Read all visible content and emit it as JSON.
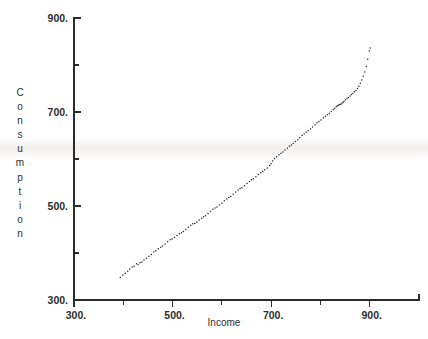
{
  "chart_data": {
    "type": "scatter",
    "title": "",
    "xlabel": "Income",
    "ylabel": "Consumption",
    "xlim": [
      300,
      1000
    ],
    "ylim": [
      300,
      900
    ],
    "grid": false,
    "legend": null,
    "x_ticks": [
      300,
      400,
      500,
      600,
      700,
      800,
      900,
      1000
    ],
    "x_tick_labels": [
      "300.",
      "",
      "500.",
      "",
      "700.",
      "",
      "900.",
      ""
    ],
    "y_ticks": [
      300,
      400,
      500,
      600,
      700,
      800,
      900
    ],
    "y_tick_labels": [
      "300.",
      "",
      "500.",
      "",
      "700.",
      "",
      "900."
    ],
    "marker": "dot",
    "marker_size": 1.5,
    "marker_color": "#23262b",
    "points": [
      [
        394,
        348
      ],
      [
        399,
        353
      ],
      [
        404,
        357
      ],
      [
        409,
        361
      ],
      [
        413,
        366
      ],
      [
        418,
        370
      ],
      [
        422,
        372
      ],
      [
        427,
        377
      ],
      [
        430,
        375
      ],
      [
        434,
        379
      ],
      [
        438,
        381
      ],
      [
        442,
        385
      ],
      [
        447,
        389
      ],
      [
        452,
        393
      ],
      [
        457,
        397
      ],
      [
        462,
        402
      ],
      [
        466,
        405
      ],
      [
        471,
        409
      ],
      [
        476,
        412
      ],
      [
        480,
        415
      ],
      [
        485,
        419
      ],
      [
        490,
        424
      ],
      [
        495,
        428
      ],
      [
        499,
        430
      ],
      [
        504,
        433
      ],
      [
        509,
        437
      ],
      [
        514,
        441
      ],
      [
        518,
        443
      ],
      [
        522,
        446
      ],
      [
        527,
        450
      ],
      [
        532,
        455
      ],
      [
        537,
        459
      ],
      [
        541,
        462
      ],
      [
        545,
        463
      ],
      [
        549,
        466
      ],
      [
        554,
        470
      ],
      [
        559,
        474
      ],
      [
        563,
        477
      ],
      [
        567,
        479
      ],
      [
        572,
        484
      ],
      [
        577,
        489
      ],
      [
        582,
        493
      ],
      [
        586,
        496
      ],
      [
        590,
        498
      ],
      [
        595,
        502
      ],
      [
        600,
        506
      ],
      [
        605,
        511
      ],
      [
        610,
        515
      ],
      [
        614,
        518
      ],
      [
        618,
        520
      ],
      [
        623,
        525
      ],
      [
        628,
        530
      ],
      [
        633,
        534
      ],
      [
        637,
        537
      ],
      [
        641,
        539
      ],
      [
        646,
        543
      ],
      [
        651,
        548
      ],
      [
        656,
        552
      ],
      [
        660,
        556
      ],
      [
        664,
        558
      ],
      [
        669,
        562
      ],
      [
        674,
        567
      ],
      [
        679,
        571
      ],
      [
        683,
        574
      ],
      [
        687,
        577
      ],
      [
        692,
        581
      ],
      [
        697,
        586
      ],
      [
        700,
        590
      ],
      [
        703,
        596
      ],
      [
        707,
        601
      ],
      [
        711,
        605
      ],
      [
        716,
        609
      ],
      [
        720,
        612
      ],
      [
        724,
        615
      ],
      [
        728,
        619
      ],
      [
        733,
        623
      ],
      [
        737,
        627
      ],
      [
        741,
        630
      ],
      [
        745,
        633
      ],
      [
        749,
        637
      ],
      [
        754,
        641
      ],
      [
        758,
        645
      ],
      [
        763,
        650
      ],
      [
        767,
        653
      ],
      [
        771,
        657
      ],
      [
        775,
        660
      ],
      [
        780,
        664
      ],
      [
        784,
        668
      ],
      [
        789,
        673
      ],
      [
        793,
        677
      ],
      [
        797,
        680
      ],
      [
        801,
        683
      ],
      [
        806,
        687
      ],
      [
        810,
        691
      ],
      [
        814,
        694
      ],
      [
        818,
        697
      ],
      [
        822,
        701
      ],
      [
        826,
        705
      ],
      [
        829,
        708
      ],
      [
        832,
        711
      ],
      [
        834,
        713
      ],
      [
        836,
        714
      ],
      [
        838,
        716
      ],
      [
        840,
        716
      ],
      [
        842,
        717
      ],
      [
        844,
        719
      ],
      [
        846,
        721
      ],
      [
        848,
        723
      ],
      [
        851,
        726
      ],
      [
        854,
        729
      ],
      [
        857,
        731
      ],
      [
        860,
        734
      ],
      [
        863,
        737
      ],
      [
        866,
        740
      ],
      [
        869,
        743
      ],
      [
        872,
        746
      ],
      [
        875,
        750
      ],
      [
        878,
        755
      ],
      [
        881,
        761
      ],
      [
        884,
        768
      ],
      [
        887,
        776
      ],
      [
        890,
        785
      ],
      [
        893,
        797
      ],
      [
        896,
        812
      ],
      [
        899,
        830
      ],
      [
        901,
        836
      ]
    ]
  },
  "axis": {
    "x_title": "Income",
    "y_title_letters": [
      "C",
      "o",
      "n",
      "s",
      "u",
      "m",
      "p",
      "t",
      "i",
      "o",
      "n"
    ]
  },
  "colors": {
    "ink": "#2b2b2b",
    "marker": "#23262b",
    "background": "#ffffff"
  }
}
